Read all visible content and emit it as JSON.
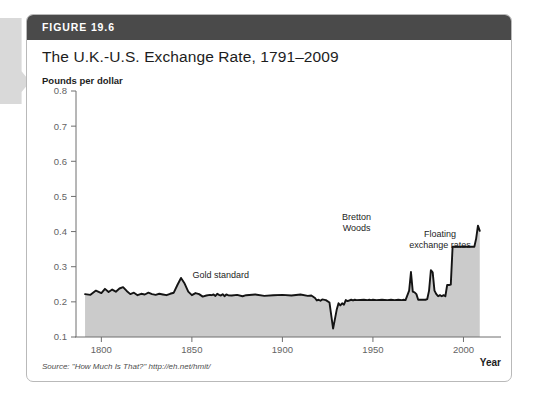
{
  "figure": {
    "number_label": "FIGURE 19.6",
    "title": "The U.K.-U.S. Exchange Rate, 1791–2009",
    "source": "Source: \"How Much Is That?\" http://eh.net/hmit/",
    "header_color": "#4a4a4a",
    "card_border_color": "#b9b9b9"
  },
  "chart_data": {
    "type": "area",
    "title": "The U.K.-U.S. Exchange Rate, 1791–2009",
    "xlabel": "Year",
    "ylabel": "Pounds per dollar",
    "xlim": [
      1786,
      2013
    ],
    "ylim": [
      0.1,
      0.8
    ],
    "xticks": [
      1800,
      1850,
      1900,
      1950,
      2000
    ],
    "xtick_labels": [
      "1800",
      "1850",
      "1900",
      "1950",
      "2000"
    ],
    "yticks": [
      0.1,
      0.2,
      0.3,
      0.4,
      0.5,
      0.6,
      0.7,
      0.8
    ],
    "ytick_labels": [
      "0.1",
      "0.2",
      "0.3",
      "0.4",
      "0.5",
      "0.6",
      "0.7",
      "0.8"
    ],
    "grid": false,
    "legend": "none",
    "line_color": "#141414",
    "fill_color": "#cbcbcb",
    "series_name": "Pounds per dollar",
    "annotations": [
      {
        "text": "Gold standard",
        "x": 1866,
        "y": 0.268,
        "lines": [
          "Gold standard"
        ]
      },
      {
        "text": "Bretton Woods",
        "x": 1941,
        "y": 0.432,
        "lines": [
          "Bretton",
          "Woods"
        ]
      },
      {
        "text": "Floating exchange rates",
        "x": 1987,
        "y": 0.385,
        "lines": [
          "Floating",
          "exchange rates"
        ]
      }
    ],
    "x": [
      1791,
      1794,
      1797,
      1800,
      1802,
      1804,
      1806,
      1808,
      1810,
      1812,
      1814,
      1816,
      1818,
      1820,
      1822,
      1824,
      1826,
      1828,
      1830,
      1832,
      1834,
      1836,
      1838,
      1840,
      1842,
      1844,
      1846,
      1848,
      1850,
      1852,
      1854,
      1856,
      1858,
      1860,
      1861,
      1862,
      1863,
      1864,
      1865,
      1866,
      1867,
      1868,
      1869,
      1870,
      1872,
      1875,
      1878,
      1880,
      1885,
      1890,
      1895,
      1900,
      1905,
      1910,
      1914,
      1916,
      1918,
      1919,
      1920,
      1921,
      1922,
      1924,
      1926,
      1928,
      1930,
      1931,
      1932,
      1933,
      1934,
      1935,
      1936,
      1938,
      1939,
      1940,
      1941,
      1945,
      1947,
      1948,
      1949,
      1950,
      1952,
      1955,
      1958,
      1960,
      1962,
      1964,
      1966,
      1967,
      1968,
      1970,
      1971,
      1972,
      1973,
      1974,
      1975,
      1976,
      1977,
      1978,
      1979,
      1980,
      1981,
      1982,
      1983,
      1984,
      1985,
      1986,
      1987,
      1988,
      1989,
      1990,
      1991,
      1992,
      1993,
      1994,
      1995,
      1996,
      1997,
      1998,
      1999,
      2000,
      2001,
      2002,
      2003,
      2004,
      2005,
      2006,
      2007,
      2008,
      2009
    ],
    "y": [
      0.222,
      0.22,
      0.232,
      0.225,
      0.237,
      0.228,
      0.235,
      0.229,
      0.238,
      0.242,
      0.231,
      0.222,
      0.226,
      0.219,
      0.223,
      0.221,
      0.226,
      0.222,
      0.22,
      0.223,
      0.221,
      0.219,
      0.223,
      0.226,
      0.248,
      0.268,
      0.252,
      0.229,
      0.219,
      0.225,
      0.222,
      0.215,
      0.218,
      0.22,
      0.219,
      0.221,
      0.217,
      0.223,
      0.22,
      0.218,
      0.222,
      0.216,
      0.221,
      0.219,
      0.218,
      0.22,
      0.216,
      0.219,
      0.221,
      0.217,
      0.219,
      0.22,
      0.218,
      0.221,
      0.217,
      0.218,
      0.211,
      0.204,
      0.206,
      0.203,
      0.207,
      0.205,
      0.198,
      0.124,
      0.178,
      0.196,
      0.19,
      0.196,
      0.192,
      0.205,
      0.202,
      0.206,
      0.204,
      0.206,
      0.205,
      0.206,
      0.205,
      0.206,
      0.205,
      0.206,
      0.205,
      0.206,
      0.205,
      0.206,
      0.205,
      0.206,
      0.205,
      0.206,
      0.205,
      0.232,
      0.285,
      0.229,
      0.227,
      0.222,
      0.206,
      0.206,
      0.206,
      0.206,
      0.206,
      0.208,
      0.232,
      0.29,
      0.284,
      0.232,
      0.222,
      0.216,
      0.219,
      0.216,
      0.219,
      0.216,
      0.248,
      0.248,
      0.249,
      0.357,
      0.357,
      0.357,
      0.357,
      0.357,
      0.357,
      0.357,
      0.357,
      0.357,
      0.357,
      0.357,
      0.357,
      0.357,
      0.38,
      0.417,
      0.402,
      0.428,
      0.445,
      0.42,
      0.428,
      0.45,
      0.494,
      0.572,
      0.52,
      0.432,
      0.48,
      0.432,
      0.488,
      0.43,
      0.437,
      0.48,
      0.576,
      0.702,
      0.77,
      0.682,
      0.61,
      0.56,
      0.61,
      0.568,
      0.562,
      0.608,
      0.634,
      0.668,
      0.654,
      0.596,
      0.64,
      0.67,
      0.64,
      0.612,
      0.648,
      0.604,
      0.62,
      0.66,
      0.69,
      0.694,
      0.666,
      0.612,
      0.546,
      0.546,
      0.55,
      0.512,
      0.496,
      0.542,
      0.622
    ]
  }
}
